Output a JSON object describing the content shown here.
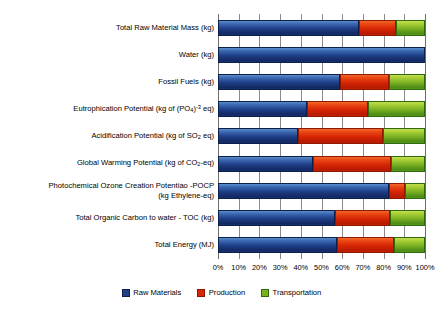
{
  "chart_data": {
    "type": "bar",
    "subtype": "stacked-horizontal-100pct",
    "title": "",
    "xlabel": "",
    "ylabel": "",
    "xlim": [
      0,
      100
    ],
    "xticks": [
      "0%",
      "10%",
      "20%",
      "30%",
      "40%",
      "50%",
      "60%",
      "70%",
      "80%",
      "90%",
      "100%"
    ],
    "xtick_values": [
      0,
      10,
      20,
      30,
      40,
      50,
      60,
      70,
      80,
      90,
      100
    ],
    "grid": true,
    "grid_axis": "x",
    "legend_position": "bottom",
    "orientation": "horizontal",
    "categories": [
      "Total Raw Material Mass (kg)",
      "Water (kg)",
      "Fossil Fuels (kg)",
      "Eutrophication Potential (kg of (PO4)-3 eq)",
      "Acidification Potential (kg of SO2 eq)",
      "Global Warming Potential (kg of CO2-eq)",
      "Photochemical Ozone Creation Potentiao -POCP (kg Ethylene-eq)",
      "Total Organic Carbon to water - TOC (kg)",
      "Total Energy (MJ)"
    ],
    "series": [
      {
        "name": "Raw Materials",
        "color": "#1f3f89",
        "values": [
          68,
          100,
          59,
          43,
          38.5,
          46,
          82.5,
          56.5,
          57.5
        ]
      },
      {
        "name": "Production",
        "color": "#d62605",
        "values": [
          18,
          0,
          23.5,
          29.5,
          41,
          37.5,
          8,
          26.5,
          27.5
        ]
      },
      {
        "name": "Transportation",
        "color": "#7ab022",
        "values": [
          14,
          0,
          17.5,
          27.5,
          20.5,
          16.5,
          9.5,
          17,
          15
        ]
      }
    ]
  },
  "categories_display": [
    {
      "lines": [
        [
          {
            "t": "Total Raw Material Mass (kg)"
          }
        ]
      ]
    },
    {
      "lines": [
        [
          {
            "t": "Water (kg)"
          }
        ]
      ]
    },
    {
      "lines": [
        [
          {
            "t": "Fossil Fuels (kg)"
          }
        ]
      ]
    },
    {
      "lines": [
        [
          {
            "t": "Eutrophication Potential (kg of (PO"
          },
          {
            "t": "4",
            "s": "sub"
          },
          {
            "t": ")"
          },
          {
            "t": "-3",
            "s": "sup"
          },
          {
            "t": " eq)"
          }
        ]
      ]
    },
    {
      "lines": [
        [
          {
            "t": "Acidification Potential (kg of SO"
          },
          {
            "t": "2",
            "s": "sub"
          },
          {
            "t": " eq)"
          }
        ]
      ]
    },
    {
      "lines": [
        [
          {
            "t": "Global Warming Potential (kg of CO"
          },
          {
            "t": "2",
            "s": "sub"
          },
          {
            "t": "-eq)"
          }
        ]
      ]
    },
    {
      "lines": [
        [
          {
            "t": "Photochemical Ozone Creation Potentiao -POCP"
          }
        ],
        [
          {
            "t": "(kg Ethylene-eq)"
          }
        ]
      ]
    },
    {
      "lines": [
        [
          {
            "t": "Total Organic Carbon to water - TOC (kg)"
          }
        ]
      ]
    },
    {
      "lines": [
        [
          {
            "t": "Total Energy (MJ)"
          }
        ]
      ]
    }
  ],
  "legend": {
    "items": [
      {
        "label": "Raw Materials",
        "key": "raw"
      },
      {
        "label": "Production",
        "key": "prod"
      },
      {
        "label": "Transportation",
        "key": "trans"
      }
    ]
  },
  "colors": {
    "raw_materials": "#1f3f89",
    "production": "#d62605",
    "transportation": "#7ab022",
    "grid": "#8a8a8a",
    "background": "#ffffff",
    "text": "#000000"
  }
}
